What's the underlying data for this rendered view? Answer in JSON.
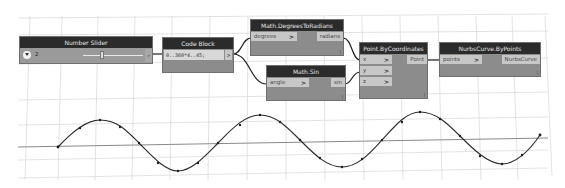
{
  "canvas": {
    "background": "#ffffff",
    "grid_color": "#d9d9d9",
    "wire_color": "#1e1e1e",
    "curve_color": "#2a2a2a"
  },
  "nodes": {
    "number_slider": {
      "title": "Number Slider",
      "value": "2",
      "toggle_icon": "chevron-down-icon",
      "output_label": ">"
    },
    "code_block": {
      "title": "Code Block",
      "code": "0..360*4..45;",
      "output_label": ">",
      "lacing_icon": ""
    },
    "degrees_to_radians": {
      "title": "Math.DegreesToRadians",
      "inputs": [
        {
          "label": "degrees",
          "arrow": ">"
        }
      ],
      "outputs": [
        {
          "label": "radians"
        }
      ],
      "lacing": "|"
    },
    "math_sin": {
      "title": "Math.Sin",
      "inputs": [
        {
          "label": "angle",
          "arrow": ">"
        }
      ],
      "outputs": [
        {
          "label": "sin"
        }
      ],
      "lacing": "|"
    },
    "point_by_coordinates": {
      "title": "Point.ByCoordinates",
      "inputs": [
        {
          "label": "x",
          "arrow": ">"
        },
        {
          "label": "y",
          "arrow": ">"
        },
        {
          "label": "z",
          "arrow": ">"
        }
      ],
      "outputs": [
        {
          "label": "Point"
        }
      ],
      "lacing": "|"
    },
    "nurbs_curve_by_points": {
      "title": "NurbsCurve.ByPoints",
      "inputs": [
        {
          "label": "points",
          "arrow": ">"
        }
      ],
      "outputs": [
        {
          "label": "NurbsCurve"
        }
      ],
      "lacing": "|"
    }
  },
  "preview": {
    "description": "Sine wave NurbsCurve rendered in 3D background preview",
    "points": [
      [
        58,
        147
      ],
      [
        80,
        128
      ],
      [
        100,
        120
      ],
      [
        120,
        127
      ],
      [
        139,
        143
      ],
      [
        158,
        163
      ],
      [
        178,
        171
      ],
      [
        198,
        163
      ],
      [
        218,
        143
      ],
      [
        240,
        125
      ],
      [
        260,
        115
      ],
      [
        280,
        122
      ],
      [
        300,
        140
      ],
      [
        320,
        158
      ],
      [
        342,
        167
      ],
      [
        362,
        159
      ],
      [
        382,
        140
      ],
      [
        402,
        122
      ],
      [
        420,
        112
      ],
      [
        440,
        119
      ],
      [
        460,
        136
      ],
      [
        480,
        156
      ],
      [
        502,
        164
      ],
      [
        522,
        155
      ],
      [
        540,
        135
      ]
    ]
  }
}
